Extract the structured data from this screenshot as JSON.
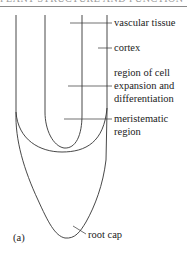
{
  "heading": "PLANT STRUCTURE AND FUNCTION",
  "figure_label": "(a)",
  "labels": {
    "vascular_tissue": "vascular tissue",
    "cortex": "cortex",
    "elongation_1": "region of cell",
    "elongation_2": "expansion and",
    "elongation_3": "differentiation",
    "meristem_1": "meristematic",
    "meristem_2": "region",
    "root_cap": "root cap"
  },
  "colors": {
    "line": "#333333",
    "text": "#222222"
  }
}
